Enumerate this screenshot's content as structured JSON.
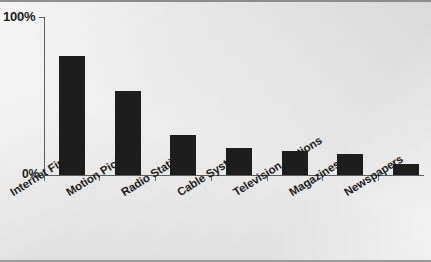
{
  "chart_data": {
    "type": "bar",
    "title": "",
    "subtitle": "",
    "xlabel": "",
    "ylabel": "",
    "categories": [
      "Internet Firms",
      "Motion Pictures",
      "Radio Stations",
      "Cable Systems",
      "Television Stations",
      "Magazines",
      "Newspapers"
    ],
    "values": [
      75,
      53,
      25,
      17,
      15,
      13,
      7
    ],
    "ylim": [
      0,
      100
    ],
    "yticks": [
      0,
      100
    ],
    "ytick_labels": [
      "0%",
      "100%"
    ],
    "grid": false,
    "legend": false,
    "bar_color": "#1d1d1d",
    "background_color": "#e4e4e4",
    "axis_color": "#5e5e5e"
  },
  "axis": {
    "y_top_label": "100%",
    "y_bottom_label": "0%"
  }
}
